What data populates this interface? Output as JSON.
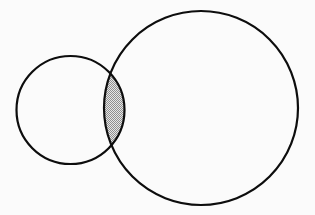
{
  "figure": {
    "title": "Two overlapping circles Venn diagram",
    "width": 315,
    "height": 215,
    "background_color": "#fbfbfb",
    "stroke_color": "#0d0d0d",
    "stroke_width": 2.2,
    "shading_color": "#9a9a9a",
    "shading_background": "#e2e2e2",
    "shading_style": "stipple-checker"
  },
  "shapes": {
    "small_circle": {
      "name": "small-circle",
      "cx": 70.5,
      "cy": 110,
      "r": 54,
      "fill": "none",
      "left_edge_x": 16.5,
      "right_edge_x": 124.5,
      "top_edge_y": 56,
      "bottom_edge_y": 164
    },
    "large_circle": {
      "name": "large-circle",
      "cx": 201,
      "cy": 108,
      "r": 97,
      "fill": "none",
      "left_edge_x": 104,
      "right_edge_x": 298,
      "top_edge_y": 11,
      "bottom_edge_y": 205
    },
    "intersection_lens": {
      "name": "intersection-lens",
      "label": "shaded intersection region",
      "upper_node_x": 110,
      "upper_node_y": 70,
      "lower_node_x": 110,
      "lower_node_y": 150,
      "widest_x": 124.5,
      "fill": "#d6d6d6"
    }
  },
  "chart_data": {
    "type": "venn",
    "sets": [
      {
        "name": "A",
        "role": "small-circle",
        "cx": 70.5,
        "cy": 110,
        "r": 54
      },
      {
        "name": "B",
        "role": "large-circle",
        "cx": 201,
        "cy": 108,
        "r": 97
      }
    ],
    "regions": [
      {
        "name": "A only",
        "shaded": false
      },
      {
        "name": "A and B",
        "shaded": true
      },
      {
        "name": "B only",
        "shaded": false
      }
    ],
    "labels": [],
    "legend": null,
    "grid": false
  }
}
